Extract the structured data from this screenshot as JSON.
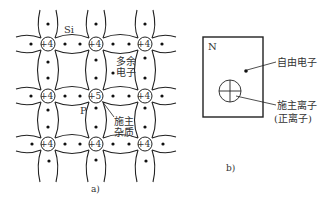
{
  "panel_a": {
    "caption": "a)",
    "labels": {
      "si": "Si",
      "p": "P",
      "excess_electron_1": "多余",
      "excess_electron_2": "电子",
      "donor_impurity_1": "施主",
      "donor_impurity_2": "杂质"
    },
    "atoms": [
      {
        "row": 0,
        "col": 0,
        "charge": "+4"
      },
      {
        "row": 0,
        "col": 1,
        "charge": "+4"
      },
      {
        "row": 0,
        "col": 2,
        "charge": "+4"
      },
      {
        "row": 1,
        "col": 0,
        "charge": "+4"
      },
      {
        "row": 1,
        "col": 1,
        "charge": "+5"
      },
      {
        "row": 1,
        "col": 2,
        "charge": "+4"
      },
      {
        "row": 2,
        "col": 0,
        "charge": "+4"
      },
      {
        "row": 2,
        "col": 1,
        "charge": "+4"
      },
      {
        "row": 2,
        "col": 2,
        "charge": "+4"
      }
    ]
  },
  "panel_b": {
    "caption": "b)",
    "region_label": "N",
    "free_electron_label": "自由电子",
    "donor_ion_label": "施主离子",
    "donor_ion_sub_label": "(正离子)"
  }
}
